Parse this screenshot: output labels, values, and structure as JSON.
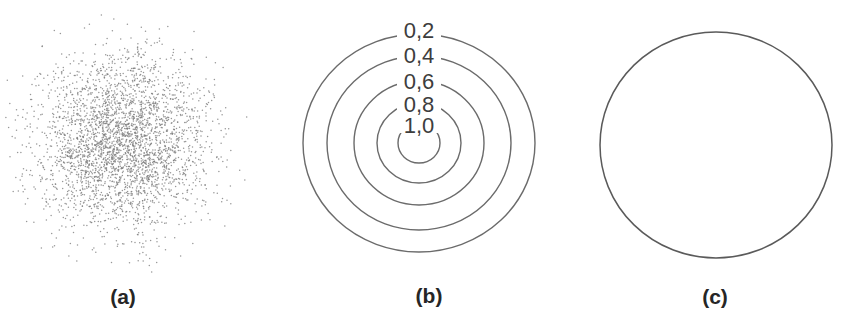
{
  "figure": {
    "background": "#ffffff",
    "panels": {
      "a": {
        "label": "(a)",
        "label_x": 123,
        "label_y": 296,
        "type": "scatter"
      },
      "b": {
        "label": "(b)",
        "label_x": 429,
        "label_y": 295,
        "type": "contour"
      },
      "c": {
        "label": "(c)",
        "label_x": 715,
        "label_y": 296,
        "type": "boundary"
      }
    }
  },
  "chart_data": [
    {
      "type": "scatter",
      "panel": "a",
      "title": "",
      "description": "Dense cloud of random sample points drawn from a circularly symmetric 2D Gaussian density",
      "n_points": 3200,
      "center_px": {
        "x": 122,
        "y": 142
      },
      "sigma_px": 43,
      "max_sigma": 3.1,
      "seed": 1337,
      "dot_color": "#7d7d7d",
      "dot_opacity": 0.8,
      "dot_r_px": 0.75
    },
    {
      "type": "contour",
      "panel": "b",
      "title": "",
      "description": "Concentric circular equal-density contours labeled with density values (decimal comma)",
      "center_px": {
        "x": 419,
        "y": 143
      },
      "stroke_color": "#6b6b6b",
      "stroke_width": 1.4,
      "label_color": "#3d3d3d",
      "gap_half_width": 22,
      "levels": [
        {
          "value": 0.2,
          "label": "0,2",
          "rx": 116,
          "ry": 109,
          "label_dy": -4
        },
        {
          "value": 0.4,
          "label": "0,4",
          "rx": 92,
          "ry": 87,
          "label_dy": -1
        },
        {
          "value": 0.6,
          "label": "0,6",
          "rx": 65,
          "ry": 62,
          "label_dy": 0
        },
        {
          "value": 0.8,
          "label": "0,8",
          "rx": 42,
          "ry": 40,
          "label_dy": 1.5
        },
        {
          "value": 1.0,
          "label": "1,0",
          "rx": 21,
          "ry": 20,
          "label_dy": 2.5
        }
      ],
      "inner_gap_rect": {
        "top_offset": -10,
        "cut_y": 133
      }
    },
    {
      "type": "boundary",
      "panel": "c",
      "title": "",
      "description": "Single circle marking the outer boundary / support region",
      "center_px": {
        "x": 716,
        "y": 145
      },
      "rx": 116,
      "ry": 113,
      "stroke_color": "#5a5a5a",
      "stroke_width": 1.5
    }
  ]
}
